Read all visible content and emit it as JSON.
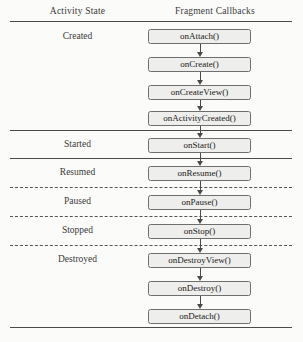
{
  "headers": {
    "activity_state": "Activity State",
    "fragment_callbacks": "Fragment Callbacks"
  },
  "states": [
    {
      "label": "Created",
      "top": 31
    },
    {
      "label": "Started",
      "top": 139
    },
    {
      "label": "Resumed",
      "top": 167
    },
    {
      "label": "Paused",
      "top": 196
    },
    {
      "label": "Stopped",
      "top": 225
    },
    {
      "label": "Destroyed",
      "top": 254
    }
  ],
  "callbacks": [
    {
      "label": "onAttach()",
      "top": 29
    },
    {
      "label": "onCreate()",
      "top": 57
    },
    {
      "label": "onCreateView()",
      "top": 85
    },
    {
      "label": "onActivityCreated()",
      "top": 111
    },
    {
      "label": "onStart()",
      "top": 138
    },
    {
      "label": "onResume()",
      "top": 166
    },
    {
      "label": "onPause()",
      "top": 195
    },
    {
      "label": "onStop()",
      "top": 224
    },
    {
      "label": "onDestroyView()",
      "top": 253
    },
    {
      "label": "onDestroy()",
      "top": 281
    },
    {
      "label": "onDetach()",
      "top": 309
    }
  ],
  "arrows": [
    {
      "top": 44,
      "shaft": 8
    },
    {
      "top": 72,
      "shaft": 8
    },
    {
      "top": 100,
      "shaft": 6
    },
    {
      "top": 126,
      "shaft": 7
    },
    {
      "top": 153,
      "shaft": 8
    },
    {
      "top": 181,
      "shaft": 9
    },
    {
      "top": 210,
      "shaft": 9
    },
    {
      "top": 239,
      "shaft": 9
    },
    {
      "top": 268,
      "shaft": 8
    },
    {
      "top": 296,
      "shaft": 8
    }
  ],
  "dividers": [
    {
      "style": "solid",
      "top": 21
    },
    {
      "style": "solid",
      "top": 130
    },
    {
      "style": "solid",
      "top": 158
    },
    {
      "style": "dashed",
      "top": 187
    },
    {
      "style": "dashed",
      "top": 216
    },
    {
      "style": "dashed",
      "top": 245
    },
    {
      "style": "solid",
      "top": 327
    }
  ],
  "diagram_data": {
    "type": "diagram",
    "title": "Fragment lifecycle callbacks mapped to Activity states",
    "columns": [
      "Activity State",
      "Fragment Callbacks"
    ],
    "rows": [
      {
        "state": "Created",
        "callbacks": [
          "onAttach()",
          "onCreate()",
          "onCreateView()",
          "onActivityCreated()"
        ],
        "divider_after": "solid"
      },
      {
        "state": "Started",
        "callbacks": [
          "onStart()"
        ],
        "divider_after": "solid"
      },
      {
        "state": "Resumed",
        "callbacks": [
          "onResume()"
        ],
        "divider_after": "dashed"
      },
      {
        "state": "Paused",
        "callbacks": [
          "onPause()"
        ],
        "divider_after": "dashed"
      },
      {
        "state": "Stopped",
        "callbacks": [
          "onStop()"
        ],
        "divider_after": "dashed"
      },
      {
        "state": "Destroyed",
        "callbacks": [
          "onDestroyView()",
          "onDestroy()",
          "onDetach()"
        ],
        "divider_after": "solid"
      }
    ],
    "flow": "sequential top-to-bottom, single arrow between each consecutive callback"
  }
}
